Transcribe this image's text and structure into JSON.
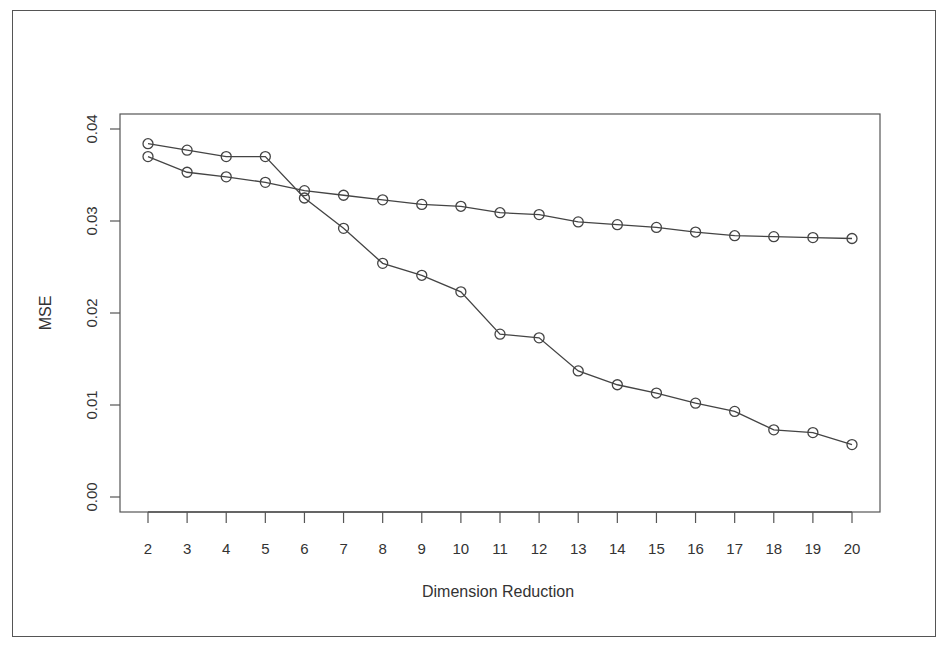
{
  "chart_data": {
    "type": "line",
    "title": "",
    "xlabel": "Dimension Reduction",
    "ylabel": "MSE",
    "x": [
      2,
      3,
      4,
      5,
      6,
      7,
      8,
      9,
      10,
      11,
      12,
      13,
      14,
      15,
      16,
      17,
      18,
      19,
      20
    ],
    "xlim": [
      2,
      20
    ],
    "ylim": [
      0.0,
      0.04
    ],
    "yticks": [
      "0.00",
      "0.01",
      "0.02",
      "0.03",
      "0.04"
    ],
    "xticks": [
      "2",
      "3",
      "4",
      "5",
      "6",
      "7",
      "8",
      "9",
      "10",
      "11",
      "12",
      "13",
      "14",
      "15",
      "16",
      "17",
      "18",
      "19",
      "20"
    ],
    "grid": false,
    "legend": null,
    "marker": "open-circle",
    "series": [
      {
        "name": "Series 1",
        "values": [
          0.0384,
          0.0377,
          0.037,
          0.037,
          0.0325,
          0.0292,
          0.0254,
          0.0241,
          0.0223,
          0.0177,
          0.0173,
          0.0137,
          0.0122,
          0.0113,
          0.0102,
          0.0093,
          0.0073,
          0.007,
          0.0057
        ]
      },
      {
        "name": "Series 2",
        "values": [
          0.037,
          0.0353,
          0.0348,
          0.0342,
          0.0333,
          0.0328,
          0.0323,
          0.0318,
          0.0316,
          0.0309,
          0.0307,
          0.0299,
          0.0296,
          0.0293,
          0.0288,
          0.0284,
          0.0283,
          0.0282,
          0.0281
        ]
      }
    ],
    "colors": {
      "line": "#444444",
      "marker": "#444444",
      "axis": "#555555",
      "text": "#333333"
    }
  }
}
